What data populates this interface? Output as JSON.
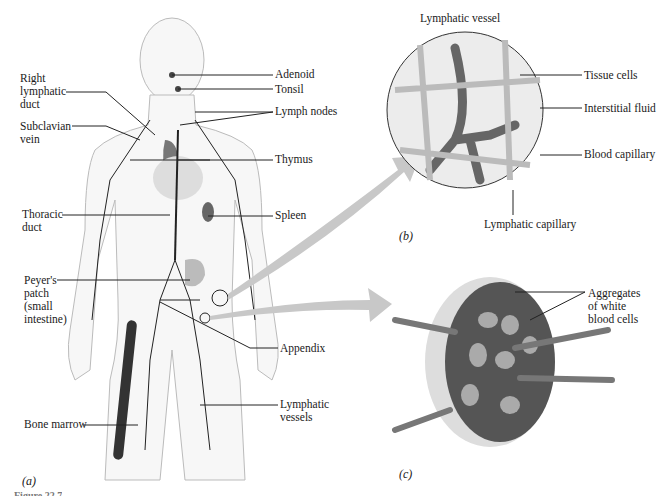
{
  "figure": {
    "panels": [
      {
        "id": "a",
        "label": "(a)"
      },
      {
        "id": "b",
        "label": "(b)",
        "title": "Lymphatic vessel"
      },
      {
        "id": "c",
        "label": "(c)"
      }
    ],
    "caption_partial": "Figure 22.7"
  },
  "panel_a": {
    "labels_left": {
      "right_lymphatic_duct": "Right\nlymphatic\nduct",
      "subclavian_vein": "Subclavian\nvein",
      "thoracic_duct": "Thoracic\nduct",
      "peyers_patch": "Peyer's\npatch\n(small\nintestine)",
      "bone_marrow": "Bone marrow"
    },
    "labels_right": {
      "adenoid": "Adenoid",
      "tonsil": "Tonsil",
      "lymph_nodes": "Lymph nodes",
      "thymus": "Thymus",
      "spleen": "Spleen",
      "appendix": "Appendix",
      "lymphatic_vessels": "Lymphatic\nvessels"
    }
  },
  "panel_b": {
    "title": "Lymphatic vessel",
    "labels": {
      "tissue_cells": "Tissue cells",
      "interstitial_fluid": "Interstitial fluid",
      "blood_capillary": "Blood capillary",
      "lymphatic_capillary": "Lymphatic capillary"
    }
  },
  "panel_c": {
    "labels": {
      "aggregates": "Aggregates\nof white\nblood cells"
    }
  },
  "colors": {
    "line": "#222222",
    "arrow_fill": "#c8c8c8",
    "tissue": "#e6e6e6",
    "node_dark": "#555555"
  }
}
